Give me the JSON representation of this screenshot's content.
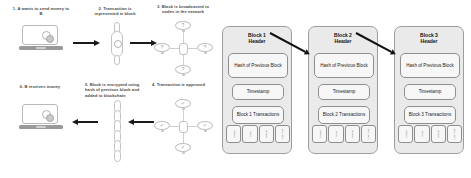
{
  "flow": {
    "steps": [
      {
        "id": "step-1",
        "caption": "1. A wants to send money to B",
        "icon": "laptop-with-coins-icon"
      },
      {
        "id": "step-2",
        "caption": "2. Transaction is represented in block",
        "icon": "chain-link-icon"
      },
      {
        "id": "step-3",
        "caption": "3. Block is broadcasted to nodes in the network",
        "icon": "node-network-icon",
        "node_mark": "?"
      },
      {
        "id": "step-4",
        "caption": "4. Transaction is approved",
        "icon": "node-network-icon",
        "node_mark": "✓"
      },
      {
        "id": "step-5",
        "caption": "5. Block is encrypted using hash of previous block and added to blockchain",
        "icon": "blockchain-links-icon"
      },
      {
        "id": "step-6",
        "caption": "6. B receives money",
        "icon": "laptop-with-coins-icon"
      }
    ]
  },
  "chain": {
    "blocks": [
      {
        "header": "Block 1\nHeader",
        "header_line1": "Block 1",
        "header_line2": "Header",
        "hash": "Hash of Previous Block",
        "timestamp": "Timestamp",
        "transactions": "Block 1 Transactions",
        "tx_cells": [
          "Sender",
          "Hash",
          "Output",
          "Last Time"
        ]
      },
      {
        "header": "Block 2\nHeader",
        "header_line1": "Block 2",
        "header_line2": "Header",
        "hash": "Hash of Previous Block",
        "timestamp": "Timestamp",
        "transactions": "Block 2 Transactions",
        "tx_cells": [
          "Sender",
          "Input",
          "Output",
          "Last Time"
        ]
      },
      {
        "header": "Block 3\nHeader",
        "header_line1": "Block 3",
        "header_line2": "Header",
        "hash": "Hash of Previous Block",
        "timestamp": "Timestamp",
        "transactions": "Block 3 Transactions",
        "tx_cells": [
          "Sender",
          "Input",
          "Output",
          "Last Time"
        ]
      }
    ]
  },
  "colors": {
    "arrow": "#1a1a1a",
    "block_fill": "#eaeaea",
    "cell_fill": "#f7f7f7",
    "outline": "#9e9e9e",
    "icon_gray": "#b9b9b9",
    "text": "#3c3c3c"
  }
}
